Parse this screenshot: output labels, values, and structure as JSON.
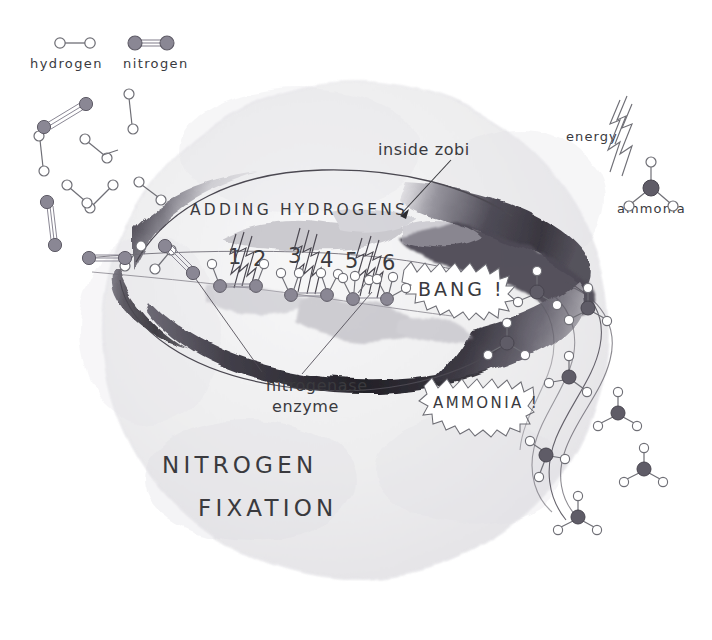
{
  "meta": {
    "title": "Nitrogen Fixation",
    "style": "hand-drawn watercolor science illustration",
    "canvas": {
      "width": 712,
      "height": 640
    }
  },
  "colors": {
    "paper": "#ffffff",
    "cell_fill": "#efeff0",
    "cell_fill_mid": "#e7e7e9",
    "ink": "#3a3a3e",
    "ink_light": "#6f6f76",
    "nitrogen_atom": "#8a8794",
    "nitrogen_atom_dark": "#5f5c67",
    "hydrogen_atom": "#ffffff",
    "hydrogen_stroke": "#6f6f76",
    "wash_dark": "#55525c",
    "wash_darkest": "#2f2d34",
    "wash_mid": "#9b99a2",
    "wash_light": "#c9c8ce",
    "wash_pale": "#dedde2"
  },
  "legend": {
    "items": [
      {
        "id": "hydrogen",
        "label": "hydrogen",
        "molecule": "H2",
        "atom_color": "hydrogen_atom",
        "bond_order": 1,
        "atoms": 2
      },
      {
        "id": "nitrogen",
        "label": "nitrogen",
        "molecule": "N2",
        "atom_color": "nitrogen_atom",
        "bond_order": 3,
        "atoms": 2
      }
    ]
  },
  "annotations": {
    "inside_cell": {
      "text": "inside zobi",
      "has_arrow": true,
      "arrow_target": "enzyme-interior"
    },
    "energy": {
      "text": "energy",
      "icon": "lightning-bolt-icon"
    },
    "ammonia_molecule": {
      "text": "ammonia",
      "molecule": "NH3",
      "center_atom": "nitrogen",
      "hydrogen_count": 3
    },
    "adding_hydrogens": {
      "text": "ADDING HYDROGENS"
    },
    "enzyme": {
      "text_line1": "nitrogenase",
      "text_line2": "enzyme",
      "leader_lines": 2
    },
    "bang_burst": {
      "text": "BANG !",
      "shape": "starburst-bubble"
    },
    "ammonia_burst": {
      "text": "AMMONIA !",
      "shape": "starburst-bubble"
    },
    "title": {
      "line1": "NITROGEN",
      "line2": "FIXATION"
    }
  },
  "reaction_steps": {
    "numbers": [
      "1",
      "2",
      "3",
      "4",
      "5",
      "6"
    ],
    "description": "Six hydrogens are added to N2 inside the nitrogenase enzyme",
    "stages": [
      {
        "label_start": "1",
        "label_end": "2",
        "hydrogens_attached": 2,
        "bolts": 3
      },
      {
        "label_start": "3",
        "label_end": "4",
        "hydrogens_attached": 4,
        "bolts": 3
      },
      {
        "label_start": "5",
        "label_end": "6",
        "hydrogens_attached": 6,
        "bolts": 3
      }
    ]
  },
  "scene": {
    "cell": {
      "shape": "circle",
      "label": "bacterial cell"
    },
    "input_molecules": {
      "hydrogen_count": 7,
      "nitrogen_count": 6,
      "region": "upper-left and left margin"
    },
    "output_molecules": {
      "ammonia_count": 9,
      "region": "right side, streaming out of cell"
    }
  }
}
